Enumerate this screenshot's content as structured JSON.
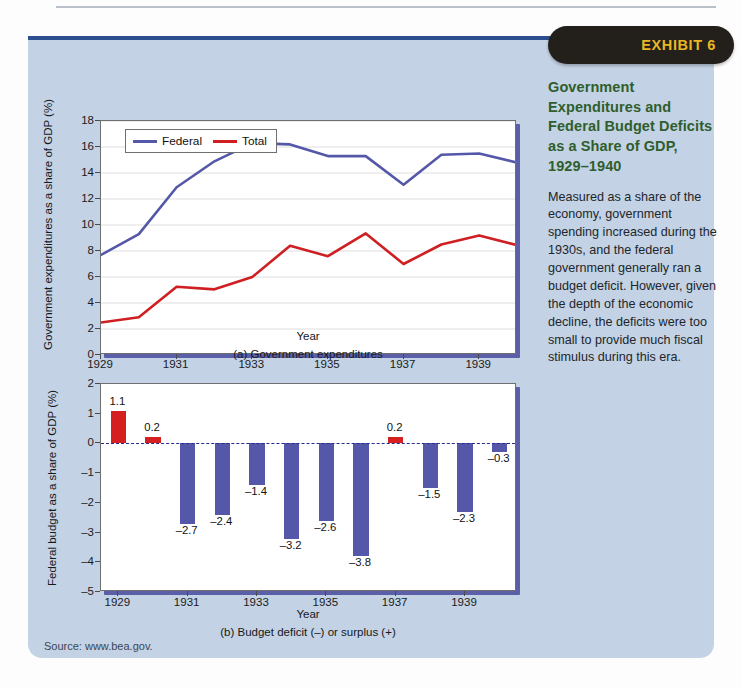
{
  "exhibit": {
    "badge_label": "EXHIBIT 6"
  },
  "sidebar": {
    "heading": "Government Expenditures and Federal Budget Deficits as a Share of GDP, 1929–1940",
    "body": "Measured as a share of the economy, government spending increased during the 1930s, and the federal government generally ran a budget deficit. However, given the depth of the economic decline, the deficits were too small to provide much fiscal stimulus during this era."
  },
  "source": {
    "text": "Source: www.bea.gov."
  },
  "colors": {
    "federal_line": "#5558a8",
    "total_line": "#cf1f22",
    "panel_bg": "#c3d2e4",
    "badge_bg": "#231f1a",
    "badge_text": "#e8b723",
    "heading_green": "#2f5e2c",
    "bar_negative": "#5558a8",
    "bar_positive": "#d4201f",
    "plot_shadow": "#5b5fa8"
  },
  "chart_data": [
    {
      "id": "panel-a",
      "type": "line",
      "title": "",
      "caption": "(a) Government expenditures",
      "xlabel": "Year",
      "ylabel": "Government expenditures as a share of GDP (%)",
      "x": [
        1929,
        1930,
        1931,
        1932,
        1933,
        1934,
        1935,
        1936,
        1937,
        1938,
        1939,
        1940
      ],
      "xlim": [
        1929,
        1940
      ],
      "ylim": [
        0,
        18
      ],
      "yticks": [
        0,
        2,
        4,
        6,
        8,
        10,
        12,
        14,
        16,
        18
      ],
      "xticks": [
        1929,
        1931,
        1933,
        1935,
        1937,
        1939
      ],
      "grid": true,
      "legend_position": "top-left",
      "series": [
        {
          "name": "Federal",
          "color": "#5558a8",
          "values": [
            7.7,
            9.3,
            12.9,
            14.9,
            16.3,
            16.2,
            15.3,
            15.3,
            13.1,
            15.4,
            15.5,
            14.8
          ]
        },
        {
          "name": "Total",
          "color": "#cf1f22",
          "values": [
            2.5,
            2.9,
            5.25,
            5.05,
            6.0,
            8.4,
            7.6,
            9.35,
            7.0,
            8.5,
            9.2,
            8.45
          ]
        }
      ]
    },
    {
      "id": "panel-b",
      "type": "bar",
      "title": "",
      "caption": "(b) Budget deficit (–) or surplus (+)",
      "xlabel": "Year",
      "ylabel": "Federal budget as a share of GDP (%)",
      "categories": [
        1929,
        1930,
        1931,
        1932,
        1933,
        1934,
        1935,
        1936,
        1937,
        1938,
        1939,
        1940
      ],
      "values": [
        1.1,
        0.2,
        -2.7,
        -2.4,
        -1.4,
        -3.2,
        -2.6,
        -3.8,
        0.2,
        -1.5,
        -2.3,
        -0.3
      ],
      "value_labels": [
        "1.1",
        "0.2",
        "–2.7",
        "–2.4",
        "–1.4",
        "–3.2",
        "–2.6",
        "–3.8",
        "0.2",
        "–1.5",
        "–2.3",
        "–0.3"
      ],
      "ylim": [
        -5,
        2
      ],
      "yticks": [
        2,
        1,
        0,
        -1,
        -2,
        -3,
        -4,
        -5
      ],
      "ytick_labels": [
        "2",
        "1",
        "0",
        "–1",
        "–2",
        "–3",
        "–4",
        "–5"
      ],
      "xticks": [
        1929,
        1931,
        1933,
        1935,
        1937,
        1939
      ],
      "grid": false,
      "zero_line": true
    }
  ]
}
